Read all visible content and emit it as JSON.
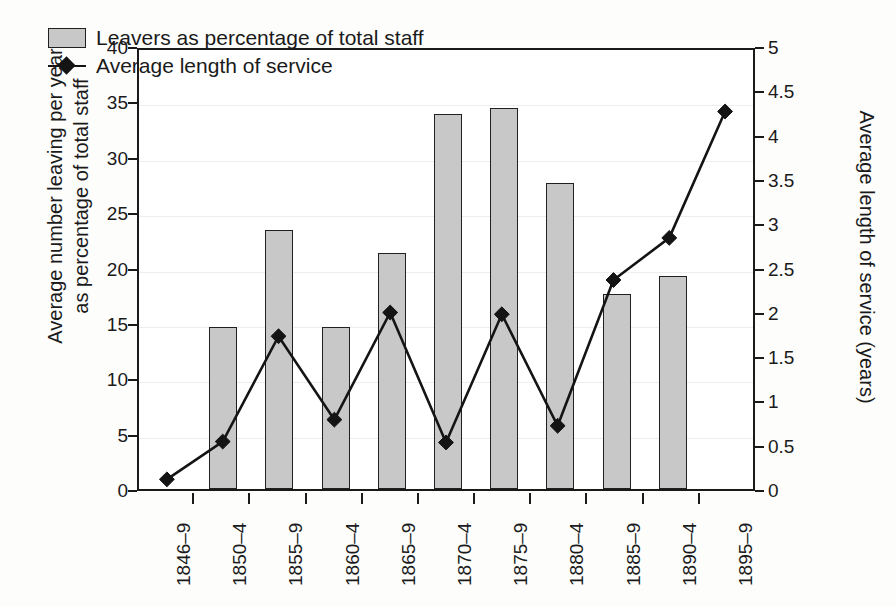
{
  "chart_data": {
    "type": "bar",
    "title": "",
    "subtitle": "",
    "categories": [
      "1846–9",
      "1850–4",
      "1855–9",
      "1860–4",
      "1865–9",
      "1870–4",
      "1875–9",
      "1880–4",
      "1885–9",
      "1890–4",
      "1895–9"
    ],
    "xlabel": "",
    "grid": true,
    "legend_position": "top-left",
    "series": [
      {
        "name": "Leavers as percentage of total staff",
        "type": "bar",
        "axis": "left",
        "color": "#c8c8c8",
        "edge_color": "#202020",
        "values": [
          0,
          14.6,
          23.4,
          14.6,
          21.3,
          33.9,
          34.4,
          27.6,
          17.6,
          19.2,
          0
        ]
      },
      {
        "name": "Average length of service",
        "type": "line",
        "axis": "right",
        "color": "#141414",
        "marker": "diamond",
        "values": [
          0.11,
          0.54,
          1.74,
          0.79,
          2.01,
          0.53,
          1.99,
          0.72,
          2.38,
          2.86,
          4.3
        ]
      }
    ],
    "left_axis": {
      "label_line1": "Average number leaving per year",
      "label_line2": "as percentage of total staff",
      "ylim": [
        0,
        40
      ],
      "ticks": [
        "0",
        "5",
        "10",
        "15",
        "20",
        "25",
        "30",
        "35",
        "40"
      ],
      "tick_values": [
        0,
        5,
        10,
        15,
        20,
        25,
        30,
        35,
        40
      ]
    },
    "right_axis": {
      "label": "Average length of service (years)",
      "ylim": [
        0,
        5
      ],
      "ticks": [
        "0",
        "0.5",
        "1",
        "1.5",
        "2",
        "2.5",
        "3",
        "3.5",
        "4",
        "4.5",
        "5"
      ],
      "tick_values": [
        0,
        0.5,
        1,
        1.5,
        2,
        2.5,
        3,
        3.5,
        4,
        4.5,
        5
      ]
    },
    "legend": [
      {
        "label": "Leavers as percentage of total staff",
        "marker": "bar-swatch"
      },
      {
        "label": "Average length of service",
        "marker": "line-diamond"
      }
    ]
  }
}
